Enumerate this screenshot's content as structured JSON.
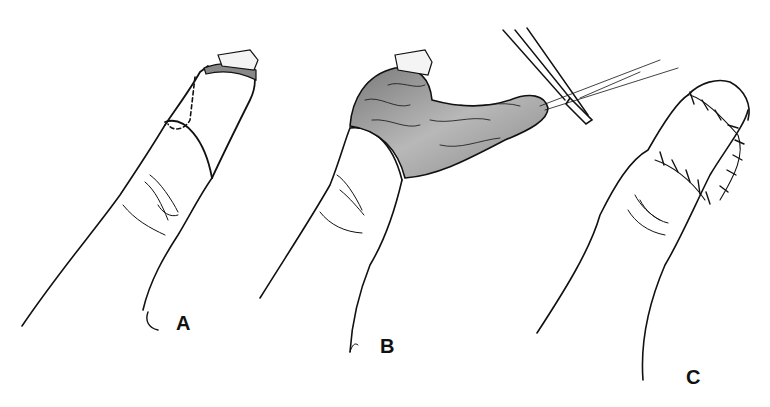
{
  "figure": {
    "panels": [
      {
        "id": "A",
        "label": "A",
        "description": "Finger with amputated tip; incision line and dashed flap outline marked"
      },
      {
        "id": "B",
        "label": "B",
        "description": "Flap raised and reflected; forceps and suture applied"
      },
      {
        "id": "C",
        "label": "C",
        "description": "Flap sutured in place covering fingertip"
      }
    ],
    "colors": {
      "ink": "#111111",
      "tissue": "#9a9a9a",
      "background": "#ffffff"
    }
  }
}
